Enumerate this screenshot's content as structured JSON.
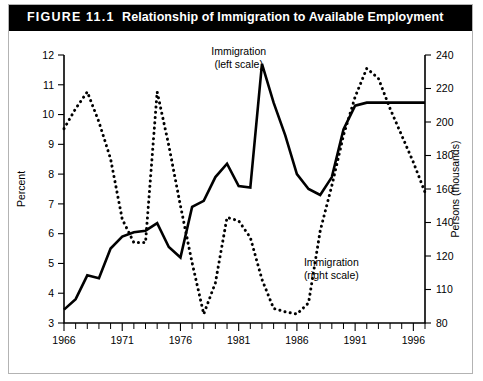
{
  "figure": {
    "number": "FIGURE 11.1",
    "title": "Relationship of Immigration to Available Employment"
  },
  "chart_data": {
    "type": "line",
    "title": "Relationship of Immigration to Available Employment",
    "xlabel": "",
    "ylabel": "Percent",
    "y2label": "Persons (thousands)",
    "grid": false,
    "legend_position": "inline-annotations",
    "xlim": [
      1966,
      1997
    ],
    "ylim": [
      3,
      12
    ],
    "y2lim": [
      80,
      240
    ],
    "xticks_labeled": [
      "1966",
      "1971",
      "1976",
      "1981",
      "1986",
      "1991",
      "1996"
    ],
    "xtick_values_labeled": [
      1966,
      1971,
      1976,
      1981,
      1986,
      1991,
      1996
    ],
    "xtick_minor_step": 1,
    "yticks_left": [
      3,
      4,
      5,
      6,
      7,
      8,
      9,
      10,
      11,
      12
    ],
    "yticklabels_left": [
      "3",
      "4",
      "5",
      "6",
      "7",
      "8",
      "9",
      "10",
      "11",
      "12"
    ],
    "yticks_right": [
      80,
      110,
      120,
      140,
      160,
      180,
      200,
      220,
      240
    ],
    "yticklabels_right": [
      "80",
      "110",
      "120",
      "140",
      "160",
      "180",
      "200",
      "220",
      "240"
    ],
    "annotations": [
      {
        "text_line1": "Immigration",
        "text_line2": "(left scale)",
        "x": 1981,
        "y": 12.0
      },
      {
        "text_line1": "Immigration",
        "text_line2": "(right scale)",
        "x": 1986.6,
        "y": 4.9
      }
    ],
    "series": [
      {
        "name": "Immigration (left scale)",
        "axis": "left",
        "style": "solid",
        "unit": "Percent",
        "x": [
          1966,
          1967,
          1968,
          1969,
          1970,
          1971,
          1972,
          1973,
          1974,
          1975,
          1976,
          1977,
          1978,
          1979,
          1980,
          1981,
          1982,
          1983,
          1984,
          1985,
          1986,
          1987,
          1988,
          1989,
          1990,
          1991,
          1992,
          1993,
          1994,
          1995,
          1996,
          1997
        ],
        "values": [
          3.45,
          3.8,
          4.6,
          4.5,
          5.5,
          5.9,
          6.05,
          6.1,
          6.35,
          5.55,
          5.2,
          6.9,
          7.1,
          7.9,
          8.35,
          7.6,
          7.55,
          11.7,
          10.4,
          9.3,
          8.0,
          7.5,
          7.3,
          7.9,
          9.5,
          10.3,
          10.4,
          10.4,
          10.4,
          10.4,
          10.4,
          10.4
        ]
      },
      {
        "name": "Immigration (right scale)",
        "axis": "right",
        "style": "dotted",
        "unit": "Persons (thousands)",
        "x": [
          1966,
          1967,
          1968,
          1969,
          1970,
          1971,
          1972,
          1973,
          1974,
          1975,
          1976,
          1977,
          1978,
          1979,
          1980,
          1981,
          1982,
          1983,
          1984,
          1985,
          1986,
          1987,
          1988,
          1989,
          1990,
          1991,
          1992,
          1993,
          1994,
          1995,
          1996,
          1997
        ],
        "values": [
          196,
          208,
          218,
          200,
          178,
          142,
          128,
          128,
          218,
          186,
          150,
          118,
          88,
          112,
          143,
          141,
          131,
          113,
          93,
          90,
          88,
          98,
          135,
          162,
          192,
          215,
          232,
          226,
          208,
          192,
          176,
          158
        ]
      }
    ]
  }
}
